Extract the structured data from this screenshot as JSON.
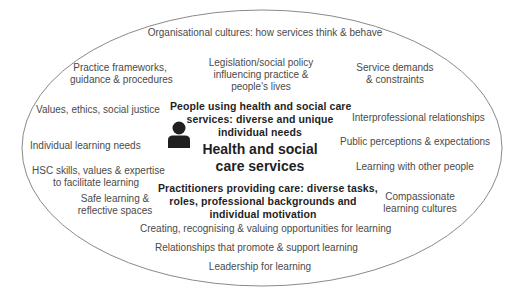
{
  "diagram": {
    "type": "ellipse-influences",
    "center": {
      "title_line1": "Health  and social",
      "title_line2": "care services",
      "people_line1": "People using health and social care",
      "people_line2": "services: diverse and unique",
      "people_line3": "individual needs",
      "practitioners_line1": "Practitioners providing care: diverse tasks,",
      "practitioners_line2": "roles, professional backgrounds and",
      "practitioners_line3": "individual motivation",
      "icon": "person-icon"
    },
    "factors": {
      "org_cultures": "Organisational cultures: how services think & behave",
      "practice_frameworks_1": "Practice frameworks,",
      "practice_frameworks_2": "guidance & procedures",
      "legislation_1": "Legislation/social policy",
      "legislation_2": "influencing practice &",
      "legislation_3": "people's lives",
      "service_demands_1": "Service demands",
      "service_demands_2": "& constraints",
      "values": "Values,   ethics, social justice",
      "interprofessional": "Interprofessional relationships",
      "individual_needs": "Individual learning needs",
      "public_perceptions": "Public perceptions     & expectations",
      "hsc_skills_1": "HSC skills, values & expertise",
      "hsc_skills_2": "to facilitate learning",
      "learning_others": "Learning with other people",
      "safe_learning_1": "Safe learning &",
      "safe_learning_2": "reflective spaces",
      "compassionate_1": "Compassionate",
      "compassionate_2": "learning cultures",
      "creating": "Creating, recognising & valuing opportunities for learning",
      "relationships": "Relationships that promote & support learning",
      "leadership": "Leadership for    learning"
    },
    "colors": {
      "outline": "#8a8a8a",
      "text": "#4a4a4a",
      "bold_text": "#1f1f1f",
      "icon": "#1f1f1f"
    }
  }
}
